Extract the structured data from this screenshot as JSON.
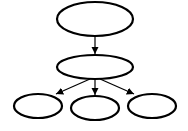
{
  "diagram": {
    "type": "tree",
    "colors": {
      "stroke": "#000000",
      "fill": "#ffffff",
      "background": "#ffffff"
    },
    "nodes": [
      {
        "id": "root",
        "label": "",
        "cx": 95,
        "cy": 19,
        "rx": 38,
        "ry": 17
      },
      {
        "id": "middle",
        "label": "",
        "cx": 95,
        "cy": 67,
        "rx": 38,
        "ry": 12
      },
      {
        "id": "child-left",
        "label": "",
        "cx": 38,
        "cy": 106,
        "rx": 24,
        "ry": 12
      },
      {
        "id": "child-center",
        "label": "",
        "cx": 95,
        "cy": 108,
        "rx": 24,
        "ry": 12
      },
      {
        "id": "child-right",
        "label": "",
        "cx": 152,
        "cy": 106,
        "rx": 24,
        "ry": 12
      }
    ],
    "edges": [
      {
        "from": "root",
        "to": "middle"
      },
      {
        "from": "middle",
        "to": "child-left"
      },
      {
        "from": "middle",
        "to": "child-center"
      },
      {
        "from": "middle",
        "to": "child-right"
      }
    ]
  }
}
